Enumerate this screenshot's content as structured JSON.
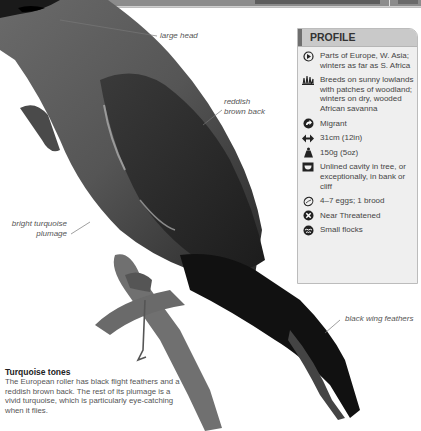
{
  "page": {
    "background": "#ffffff",
    "header_bar_color": "#8c8c8c"
  },
  "annotations": [
    {
      "id": "large-head",
      "text": "large head"
    },
    {
      "id": "reddish-brown-back",
      "lines": [
        "reddish",
        "brown back"
      ]
    },
    {
      "id": "bright-turquoise-plumage",
      "lines": [
        "bright turquoise",
        "plumage"
      ]
    },
    {
      "id": "black-wing-feathers",
      "text": "black wing feathers"
    }
  ],
  "profile": {
    "title": "PROFILE",
    "items": [
      {
        "icon": "globe-range-icon",
        "text": "Parts of Europe, W. Asia; winters as far as S. Africa"
      },
      {
        "icon": "habitat-grass-icon",
        "text": "Breeds on sunny lowlands with patches of woodland; winters on dry, wooded African savanna"
      },
      {
        "icon": "migration-arrow-icon",
        "text": "Migrant"
      },
      {
        "icon": "length-arrows-icon",
        "text": "31cm (12in)"
      },
      {
        "icon": "weight-icon",
        "text": "150g (5oz)"
      },
      {
        "icon": "nest-icon",
        "text": "Unlined cavity in tree, or exceptionally, in bank or cliff"
      },
      {
        "icon": "egg-icon",
        "text": "4–7 eggs; 1 brood"
      },
      {
        "icon": "conservation-status-icon",
        "text": "Near Threatened"
      },
      {
        "icon": "flock-icon",
        "text": "Small flocks"
      }
    ]
  },
  "note": {
    "title": "Turquoise tones",
    "body": "The European roller has black flight feathers and a reddish brown back. The rest of its plumage is a vivid turquoise, which is particularly eye-catching when it flies."
  }
}
